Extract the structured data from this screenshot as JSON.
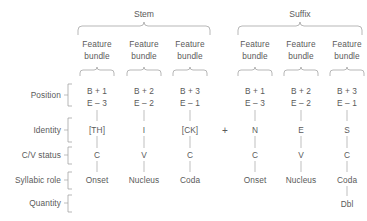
{
  "diagram": {
    "title_groups": [
      {
        "label": "Stem",
        "center_x": 144
      },
      {
        "label": "Suffix",
        "center_x": 300
      }
    ],
    "row_labels": [
      {
        "label": "Position",
        "y": 95
      },
      {
        "label": "Identity",
        "y": 130
      },
      {
        "label": "C/V status",
        "y": 155
      },
      {
        "label": "Syllabic role",
        "y": 180
      },
      {
        "label": "Quantity",
        "y": 203
      }
    ],
    "bundle_label_line1": "Feature",
    "bundle_label_line2": "bundle",
    "operator": "+",
    "columns": [
      {
        "group": "Stem",
        "center_x": 97,
        "bundle": "Feature bundle",
        "position_line1": "B + 1",
        "position_line2": "E – 3",
        "identity": "[TH]",
        "cv_status": "C",
        "syllabic_role": "Onset",
        "quantity": ""
      },
      {
        "group": "Stem",
        "center_x": 144,
        "bundle": "Feature bundle",
        "position_line1": "B + 2",
        "position_line2": "E – 2",
        "identity": "I",
        "cv_status": "V",
        "syllabic_role": "Nucleus",
        "quantity": ""
      },
      {
        "group": "Stem",
        "center_x": 190,
        "bundle": "Feature bundle",
        "position_line1": "B + 3",
        "position_line2": "E – 1",
        "identity": "[CK]",
        "cv_status": "C",
        "syllabic_role": "Coda",
        "quantity": ""
      },
      {
        "group": "Suffix",
        "center_x": 255,
        "bundle": "Feature bundle",
        "position_line1": "B + 1",
        "position_line2": "E – 3",
        "identity": "N",
        "cv_status": "C",
        "syllabic_role": "Onset",
        "quantity": ""
      },
      {
        "group": "Suffix",
        "center_x": 301,
        "bundle": "Feature bundle",
        "position_line1": "B + 2",
        "position_line2": "E – 2",
        "identity": "E",
        "cv_status": "V",
        "syllabic_role": "Nucleus",
        "quantity": ""
      },
      {
        "group": "Suffix",
        "center_x": 347,
        "bundle": "Feature bundle",
        "position_line1": "B + 3",
        "position_line2": "E – 1",
        "identity": "S",
        "cv_status": "C",
        "syllabic_role": "Coda",
        "quantity": "Dbl"
      }
    ],
    "colors": {
      "text": "#5a5a5a",
      "line": "#9a9a9a",
      "background": "#ffffff"
    }
  }
}
